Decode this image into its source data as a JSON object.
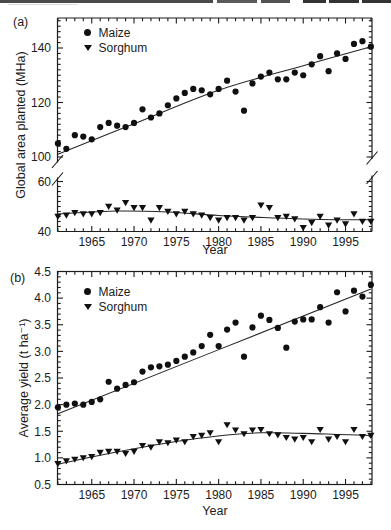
{
  "page": {
    "background": "#ffffff",
    "ink_color": "#1c1c1c",
    "marker_color": "#101010"
  },
  "chart_data": [
    {
      "type": "scatter",
      "panel_label": "(a)",
      "xlabel": "Year",
      "ylabel": "Global area planted (MHa)",
      "x_major_ticks": [
        1965,
        1970,
        1975,
        1980,
        1985,
        1990,
        1995
      ],
      "xlim": [
        1960.8,
        1998.9
      ],
      "y_axis": {
        "broken": true,
        "upper": {
          "tick_labels": [
            100,
            120,
            140
          ],
          "range": [
            100,
            152
          ],
          "minor_step": 2
        },
        "lower": {
          "tick_labels": [
            40,
            60
          ],
          "range": [
            40,
            61
          ],
          "minor_step": 2
        }
      },
      "years": [
        1961,
        1962,
        1963,
        1964,
        1965,
        1966,
        1967,
        1968,
        1969,
        1970,
        1971,
        1972,
        1973,
        1974,
        1975,
        1976,
        1977,
        1978,
        1979,
        1980,
        1981,
        1982,
        1983,
        1984,
        1985,
        1986,
        1987,
        1988,
        1989,
        1990,
        1991,
        1992,
        1993,
        1994,
        1995,
        1996,
        1997,
        1998
      ],
      "series": [
        {
          "name": "Maize",
          "marker": "circle",
          "segment": "upper",
          "values": [
            105,
            103,
            108,
            107.5,
            106.5,
            111,
            112.5,
            111.5,
            111,
            112.5,
            117.5,
            114.5,
            116,
            119,
            121.5,
            123.5,
            125,
            124.5,
            123,
            125,
            128,
            124,
            117,
            127,
            129.5,
            131,
            128.5,
            128.5,
            131,
            130,
            134,
            137,
            131.5,
            138,
            136,
            141.5,
            142.5,
            140.5
          ],
          "trend": [
            [
              1961,
              101
            ],
            [
              1970,
              112.2
            ],
            [
              1980,
              124.5
            ],
            [
              1990,
              133.5
            ],
            [
              1998,
              140.5
            ]
          ]
        },
        {
          "name": "Sorghum",
          "marker": "triangle-down",
          "segment": "lower",
          "values": [
            46,
            46.5,
            47.5,
            47,
            47,
            47.5,
            50,
            48.5,
            51.5,
            49.5,
            49.5,
            44.5,
            49.5,
            48,
            47,
            48,
            47,
            46.5,
            45.5,
            44.5,
            45.5,
            45.5,
            44.5,
            45.5,
            50.5,
            49.5,
            45.5,
            46,
            45,
            41.5,
            43.5,
            46,
            42.5,
            44.5,
            43,
            47,
            44,
            44
          ],
          "trend": [
            [
              1961,
              47.0
            ],
            [
              1968,
              48.2
            ],
            [
              1974,
              47.8
            ],
            [
              1980,
              46.4
            ],
            [
              1986,
              45.5
            ],
            [
              1992,
              44.8
            ],
            [
              1998,
              44.7
            ]
          ]
        }
      ]
    },
    {
      "type": "scatter",
      "panel_label": "(b)",
      "xlabel": "Year",
      "ylabel": "Average yield (t ha⁻¹)",
      "x_major_ticks": [
        1965,
        1970,
        1975,
        1980,
        1985,
        1990,
        1995
      ],
      "xlim": [
        1960.8,
        1998.9
      ],
      "y_axis": {
        "broken": false,
        "tick_labels": [
          "0.5",
          "1.0",
          "1.5",
          "2.0",
          "2.5",
          "3.0",
          "3.5",
          "4.0",
          "4.5"
        ],
        "ylim": [
          0.5,
          4.5
        ],
        "minor_step": 0.1
      },
      "years": [
        1961,
        1962,
        1963,
        1964,
        1965,
        1966,
        1967,
        1968,
        1969,
        1970,
        1971,
        1972,
        1973,
        1974,
        1975,
        1976,
        1977,
        1978,
        1979,
        1980,
        1981,
        1982,
        1983,
        1984,
        1985,
        1986,
        1987,
        1988,
        1989,
        1990,
        1991,
        1992,
        1993,
        1994,
        1995,
        1996,
        1997,
        1998
      ],
      "series": [
        {
          "name": "Maize",
          "marker": "circle",
          "values": [
            1.95,
            2.0,
            2.02,
            2.0,
            2.05,
            2.1,
            2.43,
            2.3,
            2.37,
            2.42,
            2.62,
            2.7,
            2.72,
            2.75,
            2.82,
            2.9,
            2.98,
            3.1,
            3.31,
            3.1,
            3.41,
            3.54,
            2.9,
            3.45,
            3.67,
            3.59,
            3.44,
            3.07,
            3.56,
            3.6,
            3.6,
            3.83,
            3.54,
            4.11,
            3.75,
            4.14,
            4.03,
            4.25
          ],
          "trend": [
            [
              1961,
              1.83
            ],
            [
              1998,
              4.17
            ]
          ]
        },
        {
          "name": "Sorghum",
          "marker": "triangle-down",
          "values": [
            0.89,
            0.94,
            0.97,
            1.0,
            1.02,
            1.1,
            1.12,
            1.12,
            1.08,
            1.12,
            1.23,
            1.2,
            1.3,
            1.28,
            1.33,
            1.3,
            1.4,
            1.42,
            1.47,
            1.3,
            1.62,
            1.52,
            1.45,
            1.52,
            1.53,
            1.45,
            1.43,
            1.38,
            1.35,
            1.38,
            1.3,
            1.53,
            1.35,
            1.4,
            1.3,
            1.53,
            1.4,
            1.42
          ],
          "trend": [
            [
              1961,
              0.88
            ],
            [
              1966,
              1.05
            ],
            [
              1971,
              1.2
            ],
            [
              1976,
              1.33
            ],
            [
              1981,
              1.43
            ],
            [
              1985,
              1.47
            ],
            [
              1990,
              1.46
            ],
            [
              1994,
              1.44
            ],
            [
              1998,
              1.42
            ]
          ]
        }
      ]
    }
  ]
}
